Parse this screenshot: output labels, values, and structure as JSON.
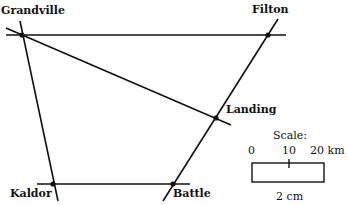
{
  "map": {
    "towns": [
      {
        "name": "Grandville",
        "x": 22,
        "y": 35
      },
      {
        "name": "Filton",
        "x": 268,
        "y": 35
      },
      {
        "name": "Landing",
        "x": 216,
        "y": 118
      },
      {
        "name": "Kaldor",
        "x": 53,
        "y": 184
      },
      {
        "name": "Battle",
        "x": 173,
        "y": 184
      }
    ],
    "roads": [
      {
        "from": "Grandville",
        "to": "Filton"
      },
      {
        "from": "Grandville",
        "to": "Landing"
      },
      {
        "from": "Grandville",
        "to": "Kaldor"
      },
      {
        "from": "Kaldor",
        "to": "Battle"
      },
      {
        "from": "Filton",
        "to": "Battle"
      }
    ]
  },
  "scale": {
    "title": "Scale:",
    "tick_0": "0",
    "tick_10": "10",
    "tick_20": "20 km",
    "bar_length": "2 cm"
  },
  "colors": {
    "line": "#111111",
    "background": "#ffffff"
  }
}
